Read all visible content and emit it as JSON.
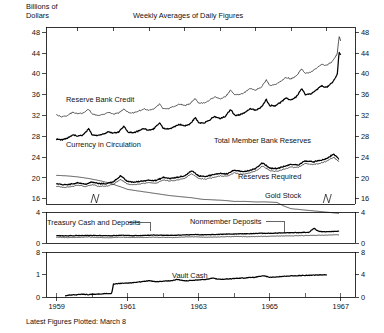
{
  "header": {
    "units_line1": "Billions of",
    "units_line2": "Dollars",
    "title": "Weekly Averages of Daily Figures",
    "footnote": "Latest Figures Plotted: March 8"
  },
  "chart_data": {
    "type": "line",
    "title": "Weekly Averages of Daily Figures",
    "ylabel": "Billions of Dollars",
    "xlabel": "",
    "grid": false,
    "legend": "inline-annotations",
    "xlim": [
      1958.7,
      1967.4
    ],
    "xticks": [
      "1959",
      "1961",
      "1963",
      "1965",
      "1967"
    ],
    "xtick_values": [
      1959,
      1961,
      1963,
      1965,
      1967
    ],
    "panels": [
      {
        "name": "main",
        "ylim": [
          15,
          49
        ],
        "yticks": [
          16,
          20,
          24,
          28,
          32,
          36,
          40,
          44,
          48
        ],
        "ytick_labels": [
          "16",
          "20",
          "24",
          "28",
          "32",
          "36",
          "40",
          "44",
          "48"
        ],
        "right_axis_same": true,
        "series": [
          {
            "name": "Currency in Circulation",
            "label": "Currency in Circulation",
            "style": "thick",
            "x": [
              1959.0,
              1959.15,
              1959.3,
              1959.45,
              1959.6,
              1959.75,
              1959.9,
              1960.0,
              1960.15,
              1960.3,
              1960.45,
              1960.6,
              1960.75,
              1960.9,
              1961.0,
              1961.15,
              1961.3,
              1961.45,
              1961.6,
              1961.75,
              1961.9,
              1962.0,
              1962.15,
              1962.3,
              1962.45,
              1962.6,
              1962.75,
              1962.9,
              1963.0,
              1963.15,
              1963.3,
              1963.45,
              1963.6,
              1963.75,
              1963.9,
              1964.0,
              1964.15,
              1964.3,
              1964.45,
              1964.6,
              1964.75,
              1964.9,
              1965.0,
              1965.15,
              1965.3,
              1965.45,
              1965.6,
              1965.75,
              1965.9,
              1966.0,
              1966.15,
              1966.3,
              1966.45,
              1966.6,
              1966.75,
              1966.9,
              1966.95,
              1967.0
            ],
            "y": [
              27.4,
              27.3,
              27.6,
              28.3,
              28.0,
              28.3,
              29.4,
              28.3,
              28.2,
              28.4,
              28.9,
              28.6,
              28.9,
              30.0,
              28.8,
              28.7,
              29.0,
              29.5,
              29.2,
              29.5,
              30.6,
              29.5,
              29.4,
              29.8,
              30.3,
              30.0,
              30.3,
              31.6,
              30.6,
              30.6,
              31.1,
              31.8,
              31.4,
              31.8,
              33.2,
              32.1,
              32.1,
              32.6,
              33.3,
              33.0,
              33.5,
              35.1,
              33.9,
              33.9,
              34.5,
              35.3,
              35.0,
              35.6,
              37.2,
              36.0,
              36.1,
              36.8,
              37.7,
              37.4,
              38.2,
              39.8,
              44.2,
              43.6
            ]
          },
          {
            "name": "Reserve Bank Credit",
            "label": "Reserve Bank Credit",
            "style": "thin",
            "x": [
              1959.0,
              1959.15,
              1959.3,
              1959.45,
              1959.6,
              1959.75,
              1959.9,
              1960.0,
              1960.15,
              1960.3,
              1960.45,
              1960.6,
              1960.75,
              1960.9,
              1961.0,
              1961.15,
              1961.3,
              1961.45,
              1961.6,
              1961.75,
              1961.9,
              1962.0,
              1962.15,
              1962.3,
              1962.45,
              1962.6,
              1962.75,
              1962.9,
              1963.0,
              1963.15,
              1963.3,
              1963.45,
              1963.6,
              1963.75,
              1963.9,
              1964.0,
              1964.15,
              1964.3,
              1964.45,
              1964.6,
              1964.75,
              1964.9,
              1965.0,
              1965.15,
              1965.3,
              1965.45,
              1965.6,
              1965.75,
              1965.9,
              1966.0,
              1966.15,
              1966.3,
              1966.45,
              1966.6,
              1966.75,
              1966.9,
              1966.95,
              1967.0
            ],
            "y": [
              32.1,
              31.7,
              32.0,
              32.6,
              32.3,
              32.5,
              33.2,
              32.3,
              32.0,
              32.2,
              32.6,
              32.3,
              32.5,
              33.3,
              32.6,
              32.5,
              32.8,
              33.3,
              33.0,
              33.3,
              34.2,
              33.3,
              33.3,
              33.7,
              34.2,
              33.9,
              34.2,
              35.3,
              34.4,
              34.4,
              34.9,
              35.6,
              35.2,
              35.6,
              36.9,
              36.0,
              36.0,
              36.5,
              37.2,
              36.9,
              37.4,
              38.8,
              37.8,
              37.9,
              38.5,
              39.3,
              39.0,
              39.6,
              41.0,
              40.1,
              40.3,
              41.0,
              41.8,
              41.6,
              42.3,
              43.8,
              47.2,
              46.3
            ]
          },
          {
            "name": "Total Member Bank Reserves",
            "label": "Total Member Bank Reserves",
            "style": "thick",
            "x": [
              1959.0,
              1959.2,
              1959.4,
              1959.6,
              1959.8,
              1960.0,
              1960.2,
              1960.4,
              1960.6,
              1960.8,
              1961.0,
              1961.2,
              1961.4,
              1961.6,
              1961.8,
              1962.0,
              1962.2,
              1962.4,
              1962.6,
              1962.8,
              1963.0,
              1963.2,
              1963.4,
              1963.6,
              1963.8,
              1964.0,
              1964.2,
              1964.4,
              1964.6,
              1964.8,
              1965.0,
              1965.2,
              1965.4,
              1965.6,
              1965.8,
              1966.0,
              1966.2,
              1966.4,
              1966.6,
              1966.8,
              1966.95
            ],
            "y": [
              18.9,
              18.7,
              18.8,
              19.1,
              18.8,
              19.2,
              18.9,
              18.9,
              19.3,
              20.4,
              19.3,
              19.2,
              19.4,
              19.6,
              19.5,
              20.1,
              19.9,
              20.1,
              20.4,
              21.4,
              20.4,
              20.3,
              20.6,
              20.9,
              20.8,
              21.5,
              21.2,
              21.4,
              21.8,
              22.9,
              21.9,
              21.8,
              22.2,
              22.6,
              22.5,
              23.3,
              23.1,
              23.3,
              23.7,
              24.6,
              23.6
            ]
          },
          {
            "name": "Reserves Required",
            "label": "Reserves Required",
            "style": "thin",
            "x": [
              1959.0,
              1959.2,
              1959.4,
              1959.6,
              1959.8,
              1960.0,
              1960.2,
              1960.4,
              1960.6,
              1960.8,
              1961.0,
              1961.2,
              1961.4,
              1961.6,
              1961.8,
              1962.0,
              1962.2,
              1962.4,
              1962.6,
              1962.8,
              1963.0,
              1963.2,
              1963.4,
              1963.6,
              1963.8,
              1964.0,
              1964.2,
              1964.4,
              1964.6,
              1964.8,
              1965.0,
              1965.2,
              1965.4,
              1965.6,
              1965.8,
              1966.0,
              1966.2,
              1966.4,
              1966.6,
              1966.8,
              1966.95
            ],
            "y": [
              18.4,
              18.2,
              18.3,
              18.6,
              18.3,
              18.7,
              18.4,
              18.4,
              18.8,
              19.7,
              18.8,
              18.7,
              18.9,
              19.1,
              19.0,
              19.6,
              19.4,
              19.6,
              19.9,
              20.8,
              19.9,
              19.8,
              20.1,
              20.4,
              20.3,
              21.0,
              20.7,
              20.9,
              21.3,
              22.3,
              21.4,
              21.3,
              21.7,
              22.1,
              22.0,
              22.8,
              22.6,
              22.8,
              23.2,
              24.0,
              23.1
            ]
          },
          {
            "name": "Gold Stock",
            "label": "Gold Stock",
            "style": "thin",
            "x": [
              1959.0,
              1959.3,
              1959.6,
              1959.9,
              1960.2,
              1960.5,
              1960.8,
              1961.0,
              1961.3,
              1961.6,
              1961.9,
              1962.2,
              1962.5,
              1962.8,
              1963.1,
              1963.4,
              1963.7,
              1964.0,
              1964.3,
              1964.6,
              1964.9,
              1965.2,
              1965.4,
              1965.6,
              1965.9,
              1966.2,
              1966.5,
              1966.8,
              1966.95
            ],
            "y": [
              20.5,
              20.4,
              20.2,
              19.9,
              19.5,
              19.0,
              18.3,
              17.8,
              17.5,
              17.2,
              16.9,
              16.6,
              16.4,
              16.2,
              15.9,
              15.8,
              15.7,
              15.5,
              15.5,
              15.4,
              15.4,
              15.3,
              14.6,
              14.1,
              13.9,
              13.7,
              13.5,
              13.3,
              13.2
            ]
          }
        ]
      },
      {
        "name": "middle",
        "ylim": [
          0,
          4
        ],
        "yticks": [
          0,
          4
        ],
        "ytick_labels": [
          "0",
          "4"
        ],
        "right_axis_same": true,
        "series": [
          {
            "name": "Nonmember Deposits",
            "label": "Nonmember Deposits",
            "style": "thick",
            "x": [
              1959.0,
              1959.3,
              1959.6,
              1959.9,
              1960.2,
              1960.5,
              1960.8,
              1961.1,
              1961.4,
              1961.7,
              1962.0,
              1962.3,
              1962.6,
              1962.9,
              1963.2,
              1963.5,
              1963.8,
              1964.1,
              1964.4,
              1964.7,
              1965.0,
              1965.3,
              1965.6,
              1965.9,
              1966.1,
              1966.25,
              1966.35,
              1966.5,
              1966.7,
              1966.9,
              1966.95
            ],
            "y": [
              0.95,
              0.92,
              0.95,
              0.98,
              0.96,
              0.94,
              1.0,
              0.95,
              0.97,
              1.02,
              1.0,
              0.98,
              1.05,
              1.08,
              1.06,
              1.1,
              1.15,
              1.18,
              1.2,
              1.25,
              1.25,
              1.3,
              1.32,
              1.35,
              1.38,
              1.9,
              1.55,
              1.45,
              1.48,
              1.5,
              1.5
            ]
          },
          {
            "name": "Treasury Cash and Deposits",
            "label": "Treasury Cash and Deposits",
            "style": "thin",
            "x": [
              1959.0,
              1959.3,
              1959.6,
              1959.9,
              1960.2,
              1960.5,
              1960.8,
              1961.1,
              1961.4,
              1961.7,
              1962.0,
              1962.3,
              1962.6,
              1962.9,
              1963.2,
              1963.5,
              1963.8,
              1964.1,
              1964.4,
              1964.7,
              1965.0,
              1965.3,
              1965.6,
              1965.9,
              1966.2,
              1966.5,
              1966.8,
              1966.95
            ],
            "y": [
              0.75,
              0.7,
              0.72,
              0.78,
              0.7,
              0.68,
              0.75,
              0.7,
              0.72,
              0.75,
              0.72,
              0.7,
              0.78,
              0.8,
              0.75,
              0.78,
              0.82,
              0.85,
              0.8,
              0.85,
              0.88,
              0.9,
              0.92,
              0.95,
              0.98,
              1.0,
              1.05,
              1.05
            ]
          }
        ]
      },
      {
        "name": "bottom",
        "ylim": [
          0,
          2
        ],
        "yticks_left": [
          0,
          1,
          8
        ],
        "ytick_labels_left": [
          "0",
          "1",
          "8"
        ],
        "yticks_right": [
          0,
          4,
          8
        ],
        "ytick_labels_right": [
          "0",
          "4",
          "8"
        ],
        "series": [
          {
            "name": "Vault Cash",
            "label": "Vault Cash",
            "style": "thick",
            "x": [
              1959.25,
              1959.4,
              1959.55,
              1959.7,
              1959.85,
              1960.0,
              1960.15,
              1960.3,
              1960.45,
              1960.55,
              1960.6,
              1960.75,
              1960.9,
              1961.0,
              1961.2,
              1961.4,
              1961.6,
              1961.8,
              1962.0,
              1962.2,
              1962.4,
              1962.6,
              1962.8,
              1963.0,
              1963.2,
              1963.4,
              1963.6,
              1963.8,
              1964.0,
              1964.2,
              1964.4,
              1964.6,
              1964.8,
              1965.0,
              1965.2,
              1965.4,
              1965.6,
              1965.8,
              1966.0,
              1966.2,
              1966.4,
              1966.6
            ],
            "y": [
              0.05,
              0.1,
              0.1,
              0.12,
              0.11,
              0.12,
              0.13,
              0.14,
              0.15,
              0.16,
              0.58,
              0.6,
              0.62,
              0.62,
              0.65,
              0.68,
              0.72,
              0.68,
              0.7,
              0.72,
              0.78,
              0.72,
              0.74,
              0.76,
              0.78,
              0.84,
              0.78,
              0.8,
              0.82,
              0.84,
              0.86,
              0.88,
              0.95,
              0.88,
              0.9,
              0.92,
              0.94,
              0.95,
              0.96,
              0.97,
              0.98,
              0.98
            ]
          }
        ]
      }
    ],
    "annotations": [
      {
        "text": "Reserve Bank Credit",
        "panel": "main"
      },
      {
        "text": "Currency in Circulation",
        "panel": "main"
      },
      {
        "text": "Total Member Bank Reserves",
        "panel": "main"
      },
      {
        "text": "Reserves Required",
        "panel": "main"
      },
      {
        "text": "Gold Stock",
        "panel": "main"
      },
      {
        "text": "Treasury Cash and Deposits",
        "panel": "middle"
      },
      {
        "text": "Nonmember Deposits",
        "panel": "middle"
      },
      {
        "text": "Vault Cash",
        "panel": "bottom"
      }
    ]
  },
  "axes": {
    "main_y": [
      "48",
      "44",
      "40",
      "36",
      "32",
      "28",
      "24",
      "20",
      "16"
    ],
    "mid_y": [
      "4",
      "0"
    ],
    "bot_y_left": [
      "8",
      "1",
      "0"
    ],
    "bot_y_right": [
      "8",
      "4",
      "0"
    ],
    "x": [
      "1959",
      "1961",
      "1963",
      "1965",
      "1967"
    ]
  }
}
